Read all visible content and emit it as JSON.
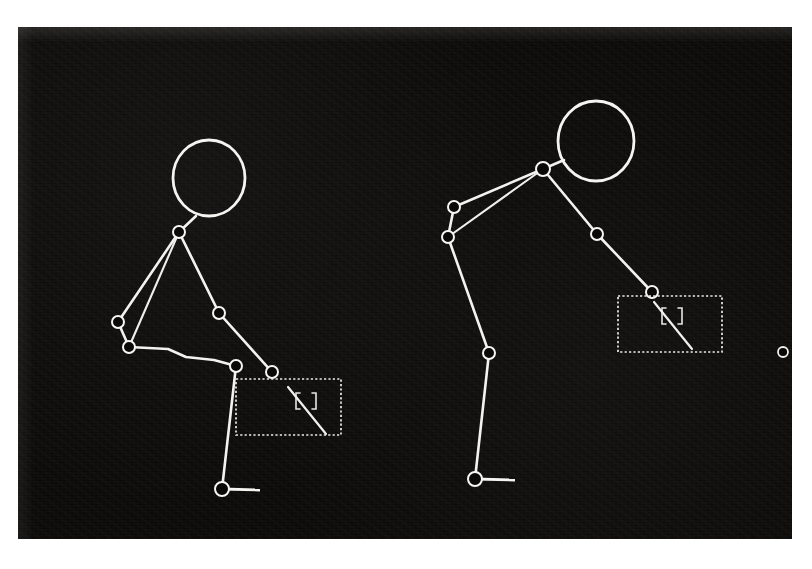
{
  "figure": {
    "background_color": "#0a0908",
    "stroke_color": "#f2f2ee",
    "page_color": "#ffffff",
    "panel": {
      "x": 18,
      "y": 27,
      "width": 774,
      "height": 512
    },
    "view_count": 2
  },
  "skeletons": [
    {
      "name": "left-skeleton",
      "label": "left-view-figure",
      "head": {
        "cx": 191,
        "cy": 151,
        "rx": 36,
        "ry": 38
      },
      "joints": [
        {
          "name": "neck-joint",
          "cx": 161,
          "cy": 205,
          "r": 6
        },
        {
          "name": "left-elbow-joint",
          "cx": 100,
          "cy": 295,
          "r": 6
        },
        {
          "name": "left-wrist-joint",
          "cx": 111,
          "cy": 320,
          "r": 6
        },
        {
          "name": "right-elbow-joint",
          "cx": 201,
          "cy": 286,
          "r": 6
        },
        {
          "name": "right-wrist-joint",
          "cx": 254,
          "cy": 345,
          "r": 6
        },
        {
          "name": "hip-joint",
          "cx": 218,
          "cy": 339,
          "r": 6
        },
        {
          "name": "ankle-joint",
          "cx": 204,
          "cy": 462,
          "r": 7
        }
      ],
      "bones": [
        {
          "name": "head-to-neck",
          "from": [
            178,
            189
          ],
          "to": [
            161,
            205
          ]
        },
        {
          "name": "neck-to-left-elbow",
          "from": [
            161,
            205
          ],
          "to": [
            100,
            295
          ]
        },
        {
          "name": "neck-to-left-wrist",
          "from": [
            161,
            205
          ],
          "to": [
            111,
            320
          ]
        },
        {
          "name": "left-elbow-to-wrist",
          "from": [
            100,
            295
          ],
          "to": [
            111,
            320
          ]
        },
        {
          "name": "neck-to-right-elbow",
          "from": [
            161,
            205
          ],
          "to": [
            201,
            286
          ]
        },
        {
          "name": "right-elbow-to-wrist",
          "from": [
            201,
            286
          ],
          "to": [
            254,
            345
          ]
        },
        {
          "name": "wrist-to-hip-torso",
          "from": [
            111,
            320
          ],
          "to": [
            218,
            339
          ]
        },
        {
          "name": "hip-to-ankle-leg",
          "from": [
            218,
            339
          ],
          "to": [
            204,
            462
          ]
        }
      ],
      "foot": {
        "name": "foot-line",
        "from": [
          204,
          462
        ],
        "to": [
          242,
          463
        ]
      },
      "bbox": {
        "name": "object-bounding-box",
        "x": 218,
        "y": 352,
        "width": 105,
        "height": 56
      },
      "object": {
        "name": "held-object",
        "bracket": {
          "x": 60,
          "y": 14,
          "width": 20,
          "height": 16
        },
        "diagonal": {
          "from": [
            52,
            8
          ],
          "to": [
            90,
            55
          ]
        }
      }
    },
    {
      "name": "right-skeleton",
      "label": "right-view-figure",
      "head": {
        "cx": 578,
        "cy": 114,
        "rx": 38,
        "ry": 40
      },
      "joints": [
        {
          "name": "neck-joint",
          "cx": 525,
          "cy": 142,
          "r": 7
        },
        {
          "name": "left-elbow-joint",
          "cx": 436,
          "cy": 180,
          "r": 6
        },
        {
          "name": "left-wrist-joint",
          "cx": 430,
          "cy": 210,
          "r": 6
        },
        {
          "name": "right-elbow-joint",
          "cx": 579,
          "cy": 207,
          "r": 6
        },
        {
          "name": "right-wrist-joint",
          "cx": 634,
          "cy": 265,
          "r": 6
        },
        {
          "name": "knee-joint",
          "cx": 471,
          "cy": 326,
          "r": 6
        },
        {
          "name": "ankle-joint",
          "cx": 457,
          "cy": 452,
          "r": 7
        }
      ],
      "bones": [
        {
          "name": "head-to-neck",
          "from": [
            546,
            133
          ],
          "to": [
            525,
            142
          ]
        },
        {
          "name": "neck-to-left-elbow",
          "from": [
            525,
            142
          ],
          "to": [
            436,
            180
          ]
        },
        {
          "name": "neck-to-left-wrist",
          "from": [
            525,
            142
          ],
          "to": [
            430,
            210
          ]
        },
        {
          "name": "left-elbow-to-wrist",
          "from": [
            436,
            180
          ],
          "to": [
            430,
            210
          ]
        },
        {
          "name": "neck-to-right-elbow",
          "from": [
            525,
            142
          ],
          "to": [
            579,
            207
          ]
        },
        {
          "name": "right-elbow-to-wrist",
          "from": [
            579,
            207
          ],
          "to": [
            634,
            265
          ]
        },
        {
          "name": "wrist-to-knee-leg",
          "from": [
            430,
            210
          ],
          "to": [
            471,
            326
          ]
        },
        {
          "name": "knee-to-ankle-leg",
          "from": [
            471,
            326
          ],
          "to": [
            457,
            452
          ]
        }
      ],
      "foot": {
        "name": "foot-line",
        "from": [
          457,
          452
        ],
        "to": [
          497,
          453
        ]
      },
      "bbox": {
        "name": "object-bounding-box",
        "x": 600,
        "y": 269,
        "width": 104,
        "height": 56
      },
      "object": {
        "name": "held-object",
        "bracket": {
          "x": 44,
          "y": 12,
          "width": 20,
          "height": 16
        },
        "diagonal": {
          "from": [
            36,
            6
          ],
          "to": [
            74,
            53
          ]
        }
      }
    }
  ],
  "stray_marker": {
    "name": "stray-joint-marker",
    "cx": 765,
    "cy": 325,
    "r": 5
  }
}
